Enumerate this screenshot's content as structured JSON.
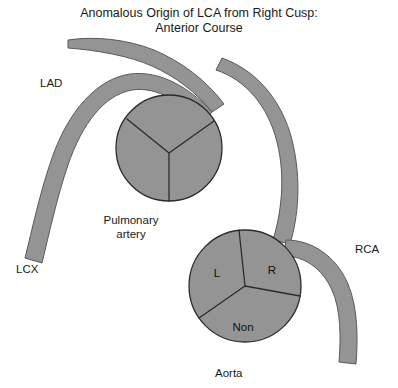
{
  "title": {
    "line1": "Anomalous Origin of LCA from Right Cusp:",
    "line2": "Anterior Course"
  },
  "labels": {
    "lad": "LAD",
    "lcx": "LCX",
    "rca": "RCA",
    "pulmonary_artery_line1": "Pulmonary",
    "pulmonary_artery_line2": "artery",
    "aorta": "Aorta"
  },
  "aortic_cusps": [
    {
      "id": "left",
      "label": "L",
      "x": 217,
      "y": 277
    },
    {
      "id": "right",
      "label": "R",
      "x": 272,
      "y": 274
    },
    {
      "id": "non",
      "label": "Non",
      "x": 243,
      "y": 331
    }
  ],
  "structures": {
    "pulmonary_artery": {
      "cx": 169,
      "cy": 148,
      "r": 53,
      "cusps": 3
    },
    "aorta": {
      "cx": 245,
      "cy": 286,
      "r": 56,
      "cusps": 3
    }
  },
  "colors": {
    "background": "#ffffff",
    "vessel_fill": "#949494",
    "vessel_stroke": "#5a5a5a",
    "chamber_stroke": "#2b2b2b",
    "text": "#1a1a1a"
  }
}
